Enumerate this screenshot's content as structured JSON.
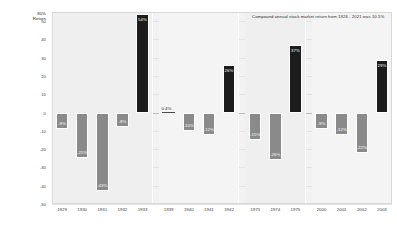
{
  "chart_data": {
    "type": "bar",
    "title": "",
    "subtitle": "",
    "xlabel": "",
    "ylabel": "Return",
    "ylabel_unit": "80%",
    "ylim": [
      -50,
      55
    ],
    "grid": true,
    "legend_position": "none",
    "annotation": "Compound annual stock market return from 1926 - 2021 was 10.5%",
    "yticks": [
      {
        "value": 50,
        "label": "50"
      },
      {
        "value": 40,
        "label": "40"
      },
      {
        "value": 30,
        "label": "30"
      },
      {
        "value": 20,
        "label": "20"
      },
      {
        "value": 10,
        "label": "10"
      },
      {
        "value": 0,
        "label": "0"
      },
      {
        "value": -10,
        "label": "-10"
      },
      {
        "value": -20,
        "label": "-20"
      },
      {
        "value": -30,
        "label": "-30"
      },
      {
        "value": -40,
        "label": "-40"
      },
      {
        "value": -50,
        "label": "-50"
      }
    ],
    "groups": [
      {
        "name": "1929-1933",
        "categories": [
          "1929",
          "1930",
          "1931",
          "1932",
          "1933"
        ],
        "values": [
          -9,
          -25,
          -43,
          -8,
          54
        ],
        "labels": [
          "-9%",
          "-25%",
          "-43%",
          "-8%",
          "54%"
        ]
      },
      {
        "name": "1939-1942",
        "categories": [
          "1939",
          "1940",
          "1941",
          "1942"
        ],
        "values": [
          0.4,
          -10,
          -12,
          26
        ],
        "labels": [
          "0.4%",
          "-10%",
          "-12%",
          "26%"
        ]
      },
      {
        "name": "1973-1975",
        "categories": [
          "1973",
          "1974",
          "1975"
        ],
        "values": [
          -15,
          -26,
          37
        ],
        "labels": [
          "-15%",
          "-26%",
          "37%"
        ]
      },
      {
        "name": "2000-2003",
        "categories": [
          "2000",
          "2001",
          "2002",
          "2003"
        ],
        "values": [
          -9,
          -12,
          -22,
          29
        ],
        "labels": [
          "-9%",
          "-12%",
          "-22%",
          "29%"
        ]
      }
    ],
    "colors": {
      "negative_bar": "#8a8a8a",
      "positive_bar": "#1c1c1c",
      "plot_background": "#efefef",
      "gridline": "#e2e2e2",
      "text": "#2b2b2b"
    }
  }
}
